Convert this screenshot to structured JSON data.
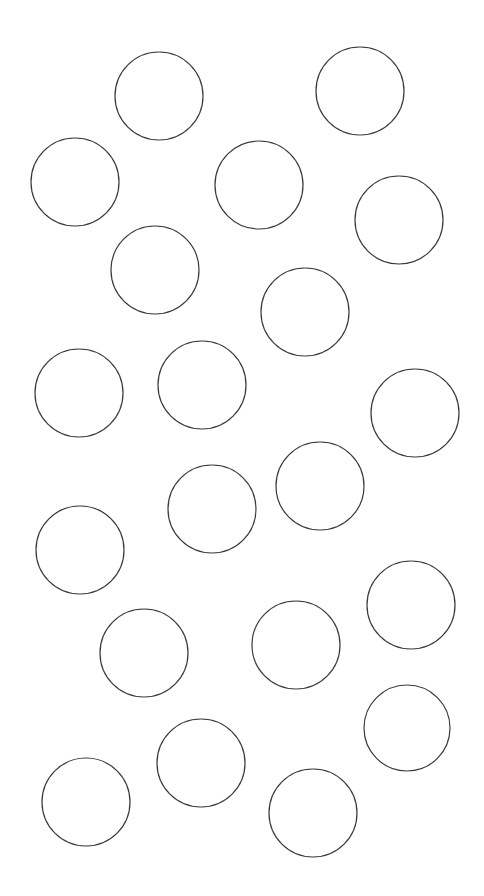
{
  "canvas": {
    "width": 484,
    "height": 896,
    "background": "#ffffff",
    "stroke_color": "#3a3a3a"
  },
  "circles": [
    {
      "cx": 159,
      "cy": 96,
      "r": 44
    },
    {
      "cx": 360,
      "cy": 91,
      "r": 44
    },
    {
      "cx": 75,
      "cy": 182,
      "r": 44
    },
    {
      "cx": 259,
      "cy": 185,
      "r": 44
    },
    {
      "cx": 399,
      "cy": 220,
      "r": 44
    },
    {
      "cx": 155,
      "cy": 270,
      "r": 44
    },
    {
      "cx": 305,
      "cy": 312,
      "r": 44
    },
    {
      "cx": 79,
      "cy": 393,
      "r": 44
    },
    {
      "cx": 202,
      "cy": 385,
      "r": 44
    },
    {
      "cx": 415,
      "cy": 413,
      "r": 44
    },
    {
      "cx": 320,
      "cy": 486,
      "r": 44
    },
    {
      "cx": 212,
      "cy": 509,
      "r": 44
    },
    {
      "cx": 80,
      "cy": 550,
      "r": 44
    },
    {
      "cx": 411,
      "cy": 605,
      "r": 44
    },
    {
      "cx": 296,
      "cy": 645,
      "r": 44
    },
    {
      "cx": 144,
      "cy": 653,
      "r": 44
    },
    {
      "cx": 407,
      "cy": 728,
      "r": 43
    },
    {
      "cx": 201,
      "cy": 763,
      "r": 44
    },
    {
      "cx": 313,
      "cy": 813,
      "r": 44
    },
    {
      "cx": 86,
      "cy": 802,
      "r": 44
    }
  ]
}
